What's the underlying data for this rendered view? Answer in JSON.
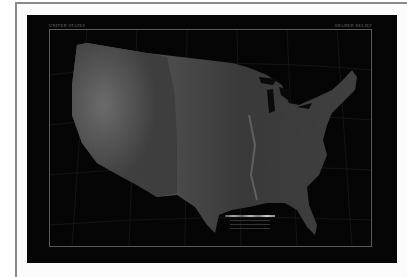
{
  "poster": {
    "title_left": "UNITED STATES",
    "title_right": "SHADED RELIEF",
    "footer_left": "",
    "footer_right": "",
    "background_color": "#050505",
    "mat_color": "#ffffff",
    "frame_color": "#8a8a8a"
  },
  "map": {
    "subject": "Contiguous United States",
    "style": "grayscale shaded relief / satellite",
    "graticule": true,
    "neatline": true
  },
  "legend": {
    "items": [
      "",
      "",
      ""
    ]
  }
}
